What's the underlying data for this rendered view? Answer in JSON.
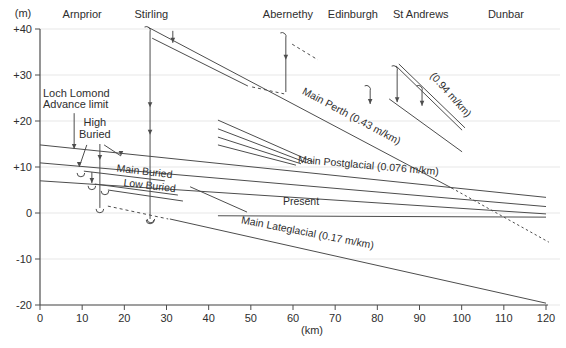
{
  "figure": {
    "background": "#ffffff",
    "line_color": "#4d4d4d",
    "grid_color": "#e7e7e7",
    "text_color": "#2e2e2e"
  },
  "chart_data": {
    "type": "line",
    "xlabel": "(km)",
    "ylabel": "(m)",
    "xlim": [
      0,
      120
    ],
    "ylim": [
      -20,
      40
    ],
    "grid": "horizontal-light",
    "x_ticks": [
      0,
      10,
      20,
      30,
      40,
      50,
      60,
      70,
      80,
      90,
      100,
      110,
      120
    ],
    "y_ticks": [
      {
        "v": 40,
        "label": "+40"
      },
      {
        "v": 30,
        "label": "+30"
      },
      {
        "v": 20,
        "label": "+20"
      },
      {
        "v": 10,
        "label": "+10"
      },
      {
        "v": 0,
        "label": "0"
      },
      {
        "v": -10,
        "label": "-10"
      },
      {
        "v": -20,
        "label": "-20"
      }
    ],
    "places": [
      {
        "name": "Arnprior",
        "km": 10.0
      },
      {
        "name": "Stirling",
        "km": 26.4
      },
      {
        "name": "Abernethy",
        "km": 58.8
      },
      {
        "name": "Edinburgh",
        "km": 74.2
      },
      {
        "name": "St Andrews",
        "km": 90.3
      },
      {
        "name": "Dunbar",
        "km": 110.5
      }
    ],
    "series": [
      {
        "name": "main-perth",
        "style": "solid",
        "points": [
          [
            25.6,
            40.4
          ],
          [
            97.7,
            5.4
          ]
        ]
      },
      {
        "name": "main-perth-extension",
        "style": "dotted",
        "points": [
          [
            97.7,
            5.4
          ],
          [
            120.6,
            -6.3
          ]
        ]
      },
      {
        "name": "perth-upper",
        "style": "solid",
        "points": [
          [
            26.6,
            38.0
          ],
          [
            49.3,
            27.6
          ]
        ]
      },
      {
        "name": "perth-upper-gap",
        "style": "dashed",
        "points": [
          [
            50.3,
            27.4
          ],
          [
            57.9,
            25.9
          ]
        ]
      },
      {
        "name": "abernethy-upper",
        "style": "dashed",
        "points": [
          [
            59.8,
            36.7
          ],
          [
            65.9,
            33.3
          ]
        ]
      },
      {
        "name": "main-postglacial",
        "style": "solid",
        "points": [
          [
            0,
            14.8
          ],
          [
            120,
            3.4
          ]
        ]
      },
      {
        "name": "postglacial-2",
        "style": "solid",
        "points": [
          [
            0,
            10.9
          ],
          [
            120,
            1.4
          ]
        ]
      },
      {
        "name": "postglacial-3",
        "style": "solid",
        "points": [
          [
            0,
            7.0
          ],
          [
            120,
            -0.2
          ]
        ]
      },
      {
        "name": "present",
        "style": "solid",
        "points": [
          [
            42.2,
            -0.6
          ],
          [
            120,
            -0.9
          ]
        ]
      },
      {
        "name": "present-leadin",
        "style": "solid",
        "points": [
          [
            35.6,
            5.7
          ],
          [
            49.1,
            0.2
          ]
        ]
      },
      {
        "name": "lateglacial-gap",
        "style": "dashed",
        "points": [
          [
            16.1,
            1.5
          ],
          [
            30.4,
            -1.3
          ]
        ]
      },
      {
        "name": "main-lateglacial",
        "style": "solid",
        "points": [
          [
            30.8,
            -1.3
          ],
          [
            120,
            -19.6
          ]
        ]
      },
      {
        "name": "postglacial-fragment-1",
        "style": "solid",
        "points": [
          [
            42.2,
            20.2
          ],
          [
            64.7,
            11.1
          ]
        ]
      },
      {
        "name": "postglacial-fragment-2",
        "style": "solid",
        "points": [
          [
            42.2,
            18.3
          ],
          [
            63.3,
            10.9
          ]
        ]
      },
      {
        "name": "postglacial-fragment-3",
        "style": "solid",
        "points": [
          [
            42.2,
            16.5
          ],
          [
            61.9,
            10.7
          ]
        ]
      },
      {
        "name": "postglacial-fragment-4",
        "style": "solid",
        "points": [
          [
            42.2,
            14.8
          ],
          [
            60.7,
            10.4
          ]
        ]
      },
      {
        "name": "east-fife-steep-1a",
        "style": "solid",
        "points": [
          [
            84.4,
            32.0
          ],
          [
            100.1,
            18.0
          ]
        ]
      },
      {
        "name": "east-fife-steep-1b",
        "style": "solid",
        "points": [
          [
            85.1,
            32.4
          ],
          [
            100.8,
            18.5
          ]
        ]
      },
      {
        "name": "east-fife-steep-2",
        "style": "solid",
        "points": [
          [
            82.8,
            24.8
          ],
          [
            100.1,
            13.3
          ]
        ]
      },
      {
        "name": "high-buried-beach",
        "style": "solid",
        "points": [
          [
            10.4,
            9.1
          ],
          [
            29.6,
            7.0
          ]
        ]
      },
      {
        "name": "main-buried-beach",
        "style": "solid",
        "points": [
          [
            13.0,
            6.3
          ],
          [
            32.7,
            3.9
          ]
        ]
      },
      {
        "name": "low-buried-beach",
        "style": "solid",
        "points": [
          [
            16.1,
            5.0
          ],
          [
            33.9,
            2.6
          ]
        ]
      }
    ],
    "line_labels": [
      {
        "text": "Main Perth (0.43 m/km)",
        "km": 73.5,
        "m": 20.4,
        "rotate": 28
      },
      {
        "text": "(0.94 m/km)",
        "km": 96.8,
        "m": 25.2,
        "rotate": 48
      },
      {
        "text": "Main Postglacial (0.076 m/km)",
        "km": 77.8,
        "m": 9.6,
        "rotate": 5
      },
      {
        "text": "Present",
        "km": 61.9,
        "m": 1.7,
        "rotate": 0
      },
      {
        "text": "Main Lateglacial (0.17 m/km)",
        "km": 63.3,
        "m": -5.0,
        "rotate": 11
      },
      {
        "text": "Main Buried",
        "km": 24.7,
        "m": 8.3,
        "rotate": 7
      },
      {
        "text": "Low Buried",
        "km": 25.9,
        "m": 5.2,
        "rotate": 7
      }
    ],
    "annotations": [
      {
        "name": "loch-lomond-advance-limit",
        "lines": [
          "Loch Lomond",
          "Advance limit"
        ],
        "km": 0.7,
        "m": 25.3,
        "align": "start"
      },
      {
        "name": "high-buried-label",
        "lines": [
          "High",
          "Buried"
        ],
        "km": 13.0,
        "m": 18.9,
        "align": "middle"
      }
    ],
    "site_verticals": [
      {
        "name": "stirling-site",
        "km": 26.1,
        "m_top": 40.0,
        "m_bottom": -1.3,
        "top_hook": true,
        "bottom_hook": true,
        "arrows_m": [
          23.0,
          17.0
        ]
      },
      {
        "name": "buried-site",
        "km": 14.2,
        "m_top": 15.0,
        "m_bottom": 1.1,
        "top_hook": false,
        "bottom_hook": true,
        "arrows_m": [
          11.5
        ]
      },
      {
        "name": "abernethy-site",
        "km": 58.3,
        "m_top": 38.7,
        "m_bottom": 26.3,
        "top_hook": true,
        "bottom_hook": false,
        "arrows_m": [
          33.3
        ]
      },
      {
        "name": "edinburgh-site",
        "km": 78.3,
        "m_top": 27.2,
        "m_bottom": 23.7,
        "top_hook": true,
        "bottom_hook": false,
        "arrow_bottom": true
      },
      {
        "name": "fife-site-1",
        "km": 84.7,
        "m_top": 31.5,
        "m_bottom": 24.1,
        "top_hook": true,
        "bottom_hook": false,
        "arrow_bottom": true
      },
      {
        "name": "fife-site-2",
        "km": 90.6,
        "m_top": 27.2,
        "m_bottom": 23.3,
        "top_hook": true,
        "bottom_hook": false,
        "arrow_bottom": true
      }
    ],
    "pointer_arrows": [
      {
        "name": "loch-lomond-limit-arrow",
        "from": [
          8.1,
          21.7
        ],
        "to": [
          8.1,
          13.9
        ]
      },
      {
        "name": "high-buried-pointer-left",
        "from": [
          11.1,
          14.8
        ],
        "to": [
          9.3,
          10.0
        ]
      },
      {
        "name": "high-buried-pointer-right",
        "from": [
          15.2,
          14.8
        ],
        "to": [
          19.2,
          12.4
        ]
      },
      {
        "name": "buried-tick-arrow",
        "from": [
          12.3,
          8.9
        ],
        "to": [
          12.3,
          6.5
        ]
      },
      {
        "name": "perth-upper-arrow",
        "from": [
          31.5,
          39.6
        ],
        "to": [
          31.5,
          37.0
        ]
      }
    ],
    "u_hooks": [
      {
        "name": "high-buried-hook",
        "km": 9.7,
        "m": 8.7
      },
      {
        "name": "main-buried-hook",
        "km": 12.3,
        "m": 5.9
      },
      {
        "name": "low-buried-hook",
        "km": 15.4,
        "m": 4.8
      },
      {
        "name": "lateglacial-hook",
        "km": 26.3,
        "m": -1.3
      }
    ]
  }
}
